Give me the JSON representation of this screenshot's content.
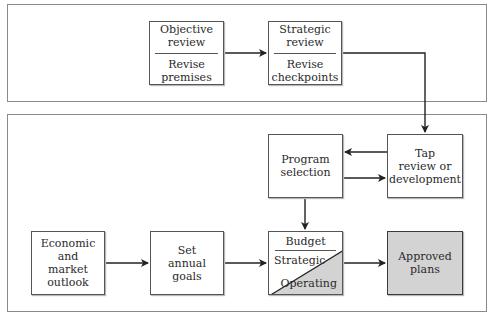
{
  "diagram": {
    "top_panel": {
      "boxes": [
        {
          "id": "objective",
          "top": "Objective\nreview",
          "bottom": "Revise\npremises"
        },
        {
          "id": "strategic",
          "top": "Strategic\nreview",
          "bottom": "Revise\ncheckpoints"
        }
      ]
    },
    "bottom_panel": {
      "boxes": [
        {
          "id": "program",
          "label": "Program\nselection"
        },
        {
          "id": "tap",
          "label": "Tap\nreview or\ndevelopment"
        },
        {
          "id": "economic",
          "label": "Economic and\nmarket\noutlook"
        },
        {
          "id": "goals",
          "label": "Set\nannual\ngoals"
        },
        {
          "id": "budget",
          "title": "Budget",
          "upper": "Strategic",
          "lower": "Operating"
        },
        {
          "id": "approved",
          "label": "Approved\nplans"
        }
      ]
    },
    "edges": [
      {
        "from": "objective",
        "to": "strategic"
      },
      {
        "from": "strategic",
        "to": "tap"
      },
      {
        "from": "tap",
        "to": "program"
      },
      {
        "from": "program",
        "to": "tap"
      },
      {
        "from": "program",
        "to": "budget"
      },
      {
        "from": "economic",
        "to": "goals"
      },
      {
        "from": "goals",
        "to": "budget"
      },
      {
        "from": "budget",
        "to": "approved"
      }
    ],
    "colors": {
      "fill": "#d3d3d3",
      "line": "#2a2a2a",
      "panel_border": "#8a8a8a"
    }
  }
}
